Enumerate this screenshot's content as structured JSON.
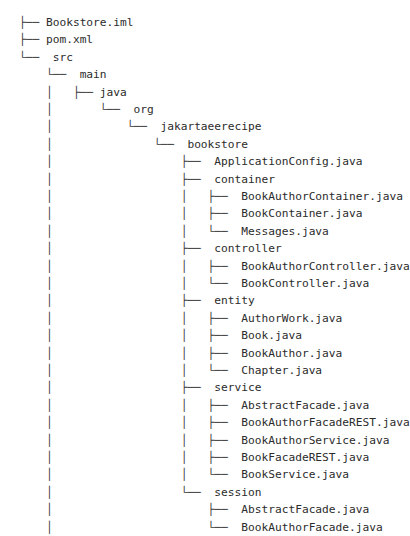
{
  "view": {
    "kind": "directory-tree",
    "background_color": "#ffffff",
    "text_color": "#2b2b2b",
    "connector_color": "#3a3a3a",
    "font_size_px": 11.2,
    "line_height_px": 17.4,
    "origin_x_px": 19,
    "origin_y_px": 14,
    "indent_px": 19.6
  },
  "tree": {
    "rows": [
      {
        "prefix": "├── ",
        "label": "Bookstore.iml",
        "depth": 0,
        "type": "file"
      },
      {
        "prefix": "├── ",
        "label": "pom.xml",
        "depth": 0,
        "type": "file"
      },
      {
        "prefix": "└── ",
        "label": " src",
        "depth": 0,
        "type": "dir"
      },
      {
        "prefix": "    └── ",
        "label": " main",
        "depth": 1,
        "type": "dir"
      },
      {
        "prefix": "    │   ├── ",
        "label": "java",
        "depth": 2,
        "type": "dir"
      },
      {
        "prefix": "    │       └── ",
        "label": " org",
        "depth": 3,
        "type": "dir"
      },
      {
        "prefix": "    │           └── ",
        "label": " jakartaeerecipe",
        "depth": 4,
        "type": "dir"
      },
      {
        "prefix": "    │               └── ",
        "label": " bookstore",
        "depth": 5,
        "type": "dir"
      },
      {
        "prefix": "    │                   ├── ",
        "label": " ApplicationConfig.java",
        "depth": 6,
        "type": "file"
      },
      {
        "prefix": "    │                   ├── ",
        "label": " container",
        "depth": 6,
        "type": "dir"
      },
      {
        "prefix": "    │                   │   ├── ",
        "label": " BookAuthorContainer.java",
        "depth": 7,
        "type": "file"
      },
      {
        "prefix": "    │                   │   ├── ",
        "label": " BookContainer.java",
        "depth": 7,
        "type": "file"
      },
      {
        "prefix": "    │                   │   └── ",
        "label": " Messages.java",
        "depth": 7,
        "type": "file"
      },
      {
        "prefix": "    │                   ├── ",
        "label": " controller",
        "depth": 6,
        "type": "dir"
      },
      {
        "prefix": "    │                   │   ├── ",
        "label": " BookAuthorController.java",
        "depth": 7,
        "type": "file"
      },
      {
        "prefix": "    │                   │   └── ",
        "label": " BookController.java",
        "depth": 7,
        "type": "file"
      },
      {
        "prefix": "    │                   ├── ",
        "label": " entity",
        "depth": 6,
        "type": "dir"
      },
      {
        "prefix": "    │                   │   ├── ",
        "label": " AuthorWork.java",
        "depth": 7,
        "type": "file"
      },
      {
        "prefix": "    │                   │   ├── ",
        "label": " Book.java",
        "depth": 7,
        "type": "file"
      },
      {
        "prefix": "    │                   │   ├── ",
        "label": " BookAuthor.java",
        "depth": 7,
        "type": "file"
      },
      {
        "prefix": "    │                   │   └── ",
        "label": " Chapter.java",
        "depth": 7,
        "type": "file"
      },
      {
        "prefix": "    │                   ├── ",
        "label": " service",
        "depth": 6,
        "type": "dir"
      },
      {
        "prefix": "    │                   │   ├── ",
        "label": " AbstractFacade.java",
        "depth": 7,
        "type": "file"
      },
      {
        "prefix": "    │                   │   ├── ",
        "label": " BookAuthorFacadeREST.java",
        "depth": 7,
        "type": "file"
      },
      {
        "prefix": "    │                   │   ├── ",
        "label": " BookAuthorService.java",
        "depth": 7,
        "type": "file"
      },
      {
        "prefix": "    │                   │   ├── ",
        "label": " BookFacadeREST.java",
        "depth": 7,
        "type": "file"
      },
      {
        "prefix": "    │                   │   └── ",
        "label": " BookService.java",
        "depth": 7,
        "type": "file"
      },
      {
        "prefix": "    │                   └── ",
        "label": " session",
        "depth": 6,
        "type": "dir"
      },
      {
        "prefix": "    │                       ├── ",
        "label": " AbstractFacade.java",
        "depth": 7,
        "type": "file"
      },
      {
        "prefix": "    │                       └── ",
        "label": " BookAuthorFacade.java",
        "depth": 7,
        "type": "file"
      }
    ]
  }
}
